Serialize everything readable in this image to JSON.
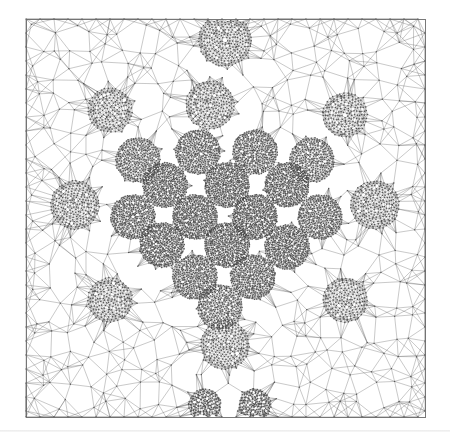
{
  "figure": {
    "title": "Triangular mesh with refined clusters",
    "background": "#ffffff",
    "edge_color": "#5a5a5a",
    "edge_alpha": 0.55,
    "node_color": "#3c3c3c",
    "border_color": "#6a6a6a",
    "domain_box": {
      "x0": 26,
      "y0": 19,
      "x1": 425,
      "y1": 417
    },
    "page_rule_y": 430,
    "coarse_spacing": 17,
    "clusters": [
      {
        "x": 225,
        "y": 40,
        "r": 26,
        "density": 0.55
      },
      {
        "x": 138,
        "y": 160,
        "r": 22,
        "density": 0.8
      },
      {
        "x": 198,
        "y": 152,
        "r": 22,
        "density": 0.85
      },
      {
        "x": 255,
        "y": 152,
        "r": 22,
        "density": 0.85
      },
      {
        "x": 312,
        "y": 160,
        "r": 22,
        "density": 0.75
      },
      {
        "x": 165,
        "y": 185,
        "r": 22,
        "density": 0.95
      },
      {
        "x": 227,
        "y": 185,
        "r": 22,
        "density": 1.0
      },
      {
        "x": 287,
        "y": 185,
        "r": 22,
        "density": 0.95
      },
      {
        "x": 133,
        "y": 217,
        "r": 22,
        "density": 0.9
      },
      {
        "x": 195,
        "y": 217,
        "r": 22,
        "density": 1.0
      },
      {
        "x": 255,
        "y": 217,
        "r": 22,
        "density": 1.0
      },
      {
        "x": 320,
        "y": 217,
        "r": 22,
        "density": 0.85
      },
      {
        "x": 162,
        "y": 245,
        "r": 22,
        "density": 0.95
      },
      {
        "x": 227,
        "y": 245,
        "r": 22,
        "density": 1.0
      },
      {
        "x": 287,
        "y": 247,
        "r": 22,
        "density": 0.95
      },
      {
        "x": 195,
        "y": 277,
        "r": 22,
        "density": 0.9
      },
      {
        "x": 253,
        "y": 277,
        "r": 22,
        "density": 0.9
      },
      {
        "x": 220,
        "y": 307,
        "r": 22,
        "density": 0.75
      },
      {
        "x": 75,
        "y": 205,
        "r": 24,
        "density": 0.45
      },
      {
        "x": 375,
        "y": 205,
        "r": 24,
        "density": 0.45
      },
      {
        "x": 210,
        "y": 105,
        "r": 24,
        "density": 0.45
      },
      {
        "x": 225,
        "y": 345,
        "r": 24,
        "density": 0.45
      },
      {
        "x": 205,
        "y": 405,
        "r": 16,
        "density": 0.6
      },
      {
        "x": 255,
        "y": 405,
        "r": 16,
        "density": 0.6
      },
      {
        "x": 345,
        "y": 115,
        "r": 22,
        "density": 0.35
      },
      {
        "x": 110,
        "y": 110,
        "r": 22,
        "density": 0.35
      },
      {
        "x": 110,
        "y": 300,
        "r": 22,
        "density": 0.35
      },
      {
        "x": 345,
        "y": 300,
        "r": 22,
        "density": 0.35
      }
    ]
  }
}
